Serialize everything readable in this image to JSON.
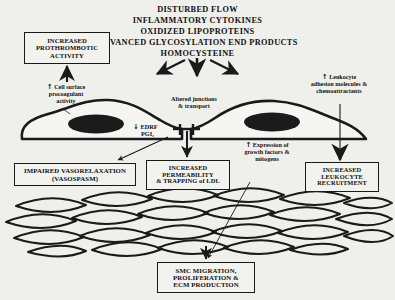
{
  "diagram": {
    "title_block": {
      "name": "stimulus-list",
      "lines": [
        "DISTURBED  FLOW",
        "INFLAMMATORY CYTOKINES",
        "OXIDIZED LIPOPROTEINS",
        "ADVANCED GLYCOSYLATION  END PRODUCTS",
        "HOMOCYSTEINE"
      ]
    },
    "boxes": {
      "prothrombotic": {
        "lines": [
          "INCREASED",
          "PROTHROMBOTIC",
          "ACTIVITY"
        ]
      },
      "vasorelaxation": {
        "lines": [
          "IMPAIRED VASORELAXATION",
          "(VASOSPASM)"
        ]
      },
      "permeability": {
        "lines": [
          "INCREASED",
          "PERMEABILITY",
          "& TRAPPING of LDL"
        ]
      },
      "leukocyte_recruitment": {
        "lines": [
          "INCREASED",
          "LEUKOCYTE",
          "RECRUITMENT"
        ]
      },
      "smc": {
        "lines": [
          "SMC MIGRATION,",
          "PROLIFERATION &",
          "ECM PRODUCTION"
        ]
      }
    },
    "annotations": {
      "procoagulant": {
        "arrow": "↑",
        "lines": [
          "Cell surface",
          "procoagulant",
          "activity"
        ]
      },
      "junctions": {
        "lines": [
          "Altered junctions",
          "& transport"
        ]
      },
      "edrf": {
        "arrow": "↓",
        "lines": [
          "EDRF",
          "PGI₂"
        ]
      },
      "leukocyte_adhesion": {
        "arrow": "↑",
        "lines": [
          "Leukocyte",
          "adhesion molecules &",
          "chemoattractants"
        ]
      },
      "growth_factors": {
        "arrow": "↑",
        "lines": [
          "Expression of",
          "growth factors &",
          "mitogens"
        ]
      }
    },
    "cells": {
      "endothelial_left_name": "endothelial-cell-left",
      "endothelial_right_name": "endothelial-cell-right",
      "smooth_muscle_layer_name": "smooth-muscle-cell-mesh"
    },
    "colors": {
      "background": "#efefec",
      "ink": "#1a1a1a",
      "nucleus": "#1b1b1b",
      "box_fill": "#f2f2ef"
    }
  }
}
